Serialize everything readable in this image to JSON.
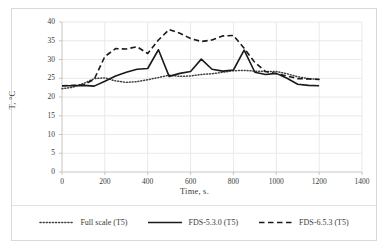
{
  "chart_data": {
    "type": "line",
    "title": "",
    "xlabel": "Time, s.",
    "ylabel": "T, °C",
    "xlim": [
      0,
      1400
    ],
    "ylim": [
      0,
      40
    ],
    "xticks": [
      0,
      200,
      400,
      600,
      800,
      1000,
      1200,
      1400
    ],
    "yticks": [
      0,
      5,
      10,
      15,
      20,
      25,
      30,
      35,
      40
    ],
    "grid": true,
    "legend_position": "bottom",
    "x": [
      0,
      50,
      100,
      150,
      200,
      250,
      300,
      350,
      400,
      450,
      500,
      550,
      600,
      650,
      700,
      750,
      800,
      850,
      900,
      950,
      1000,
      1050,
      1100,
      1150,
      1200
    ],
    "series": [
      {
        "name": "Full scale (T5)",
        "style": "dotted",
        "color": "#404040",
        "values": [
          22.2,
          22.6,
          23.6,
          24.9,
          25.1,
          24.3,
          23.9,
          24.1,
          24.6,
          25.2,
          25.8,
          25.5,
          25.6,
          26.0,
          26.2,
          26.6,
          27.0,
          27.1,
          26.9,
          26.8,
          26.8,
          26.2,
          25.4,
          24.9,
          24.7
        ]
      },
      {
        "name": "FDS-5.3.0 (T5)",
        "style": "solid",
        "color": "#1a1a1a",
        "values": [
          23.0,
          23.0,
          23.1,
          22.9,
          24.2,
          25.6,
          26.6,
          27.4,
          27.6,
          32.6,
          25.5,
          26.3,
          26.8,
          30.1,
          27.4,
          26.9,
          27.2,
          32.5,
          26.6,
          26.0,
          26.3,
          25.0,
          23.4,
          23.1,
          23.0
        ]
      },
      {
        "name": "FDS-6.5.3 (T5)",
        "style": "dashed",
        "color": "#1a1a1a",
        "values": [
          23.0,
          23.1,
          23.2,
          24.7,
          30.8,
          32.9,
          32.8,
          33.4,
          31.6,
          35.2,
          38.0,
          37.0,
          35.6,
          34.8,
          35.2,
          36.3,
          36.4,
          33.0,
          29.2,
          26.8,
          26.2,
          25.6,
          24.9,
          24.8,
          24.7
        ]
      }
    ]
  },
  "axes": {
    "xlabel": "Time, s.",
    "ylabel": "T, °C",
    "xticks": [
      "0",
      "200",
      "400",
      "600",
      "800",
      "1000",
      "1200",
      "1400"
    ],
    "yticks": [
      "40",
      "35",
      "30",
      "25",
      "20",
      "15",
      "10",
      "5",
      "0"
    ]
  },
  "legend": {
    "items": [
      {
        "label": "Full scale (T5)",
        "style": "dotted"
      },
      {
        "label": "FDS-5.3.0 (T5)",
        "style": "solid"
      },
      {
        "label": "FDS-6.5.3 (T5)",
        "style": "dashed"
      }
    ]
  },
  "colors": {
    "grid": "#e3e3e3",
    "axis": "#bfbfbf",
    "text": "#3a3a3a",
    "line_dark": "#1a1a1a",
    "line_dotted": "#404040",
    "border": "#d9d9d9",
    "background": "#ffffff"
  }
}
